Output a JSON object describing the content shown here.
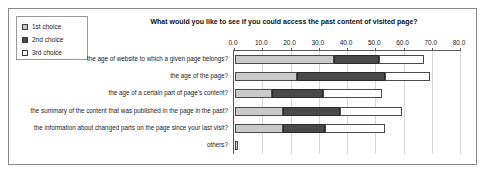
{
  "figure": {
    "title": "What would you like to see if you could access the past content of visited page?"
  },
  "legend": {
    "items": [
      {
        "label": "1st choice",
        "swatch": "light-gray"
      },
      {
        "label": "2nd choice",
        "swatch": "dark-gray"
      },
      {
        "label": "3rd choice",
        "swatch": "white"
      }
    ]
  },
  "colors": {
    "first_choice": "#c9c9c9",
    "second_choice": "#4a4a4a",
    "third_choice": "#ffffff",
    "axis": "#5a5a5a",
    "grid": "#d8d8d8",
    "frame": "#8a8a8a"
  },
  "chart_data": {
    "type": "bar",
    "orientation": "horizontal",
    "stacked": true,
    "title": "What would you like to see if you could access the past content of visited page?",
    "xlabel": "",
    "ylabel": "",
    "xlim": [
      0.0,
      80.0
    ],
    "xticks": [
      "0.0",
      "10.0",
      "20.0",
      "30.0",
      "40.0",
      "50.0",
      "60.0",
      "70.0",
      "80.0"
    ],
    "xtick_values": [
      0,
      10,
      20,
      30,
      40,
      50,
      60,
      70,
      80
    ],
    "grid": true,
    "legend_position": "top-left",
    "categories": [
      "the age of website to which a given page belongs?",
      "the age of the page?",
      "the age of a certain part of page's content?",
      "the summary of the content that was published in the page in the past?",
      "the information about changed parts on the page since your last visit?",
      "others?"
    ],
    "series": [
      {
        "name": "1st choice",
        "values": [
          35,
          22,
          13,
          17,
          17,
          1
        ]
      },
      {
        "name": "2nd choice",
        "values": [
          16,
          31,
          18,
          20,
          15,
          0
        ]
      },
      {
        "name": "3rd choice",
        "values": [
          16,
          16,
          21,
          22,
          21,
          0
        ]
      }
    ],
    "totals": [
      67,
      69,
      52,
      59,
      53,
      1
    ]
  }
}
